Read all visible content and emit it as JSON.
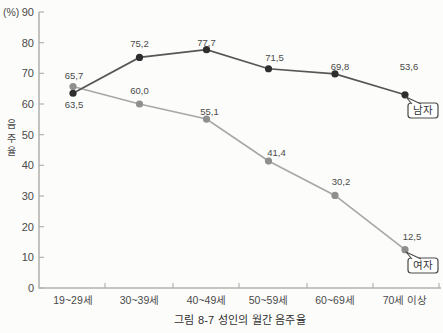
{
  "figure": {
    "caption": "그림 8-7 성인의 월간 음주율",
    "unit_label": "(%)",
    "y_axis_title": "음주율"
  },
  "colors": {
    "background": "#fcfcfa",
    "axis": "#b3b3b3",
    "tick_text": "#4a4a4a",
    "value_text": "#4a4a4a",
    "caption_text": "#2e2e2e",
    "legend_border": "#4a4a4a",
    "legend_text": "#333333"
  },
  "chart_data": {
    "type": "line",
    "title": "그림 8-7 성인의 월간 음주율",
    "unit": "%",
    "categories": [
      "19~29세",
      "30~39세",
      "40~49세",
      "50~59세",
      "60~69세",
      "70세 이상"
    ],
    "ylim": [
      0,
      90
    ],
    "y_ticks": [
      90,
      80,
      70,
      60,
      50,
      40,
      30,
      20,
      10,
      0
    ],
    "grid": false,
    "legend_position": "end-of-line-bubbles",
    "series": [
      {
        "id": "women",
        "name": "여자",
        "color_line": "#a8a8a8",
        "color_dot": "#8f8f8f",
        "values": [
          65.7,
          60.0,
          55.1,
          41.4,
          30.2,
          12.5
        ],
        "labels": [
          "65,7",
          "60,0",
          "55,1",
          "41,4",
          "30,2",
          "12,5"
        ],
        "label_offsets": [
          [
            1,
            -8
          ],
          [
            0,
            -10
          ],
          [
            3,
            -4
          ],
          [
            8,
            -5
          ],
          [
            6,
            -10
          ],
          [
            7,
            -10
          ]
        ],
        "legend": {
          "box": [
            408,
            258,
            30,
            15
          ],
          "tail_from": [
            406,
            252
          ]
        }
      },
      {
        "id": "men",
        "name": "남자",
        "color_line": "#565656",
        "color_dot": "#2e2e2e",
        "values": [
          63.5,
          75.2,
          77.7,
          71.5,
          69.8,
          53.6
        ],
        "labels": [
          "63,5",
          "75,2",
          "77,7",
          "71,5",
          "69,8",
          "53,6"
        ],
        "plot_values": [
          63.5,
          75.2,
          77.7,
          71.5,
          69.8,
          63.0
        ],
        "label_offsets": [
          [
            1,
            15
          ],
          [
            0,
            -10
          ],
          [
            0,
            -4
          ],
          [
            6,
            -8
          ],
          [
            5,
            -4
          ],
          [
            4,
            -25
          ]
        ],
        "legend": {
          "box": [
            408,
            103,
            30,
            15
          ],
          "tail_from": [
            406,
            97
          ]
        }
      }
    ],
    "geometry": {
      "axis_x": 39,
      "axis_top": 12,
      "axis_bottom": 288,
      "axis_right": 441,
      "tick_len": 5,
      "x_centers": [
        73,
        139.5,
        206.5,
        268.5,
        335,
        405
      ],
      "x_tick_x": [
        105,
        173,
        239,
        307,
        373,
        439
      ]
    }
  }
}
